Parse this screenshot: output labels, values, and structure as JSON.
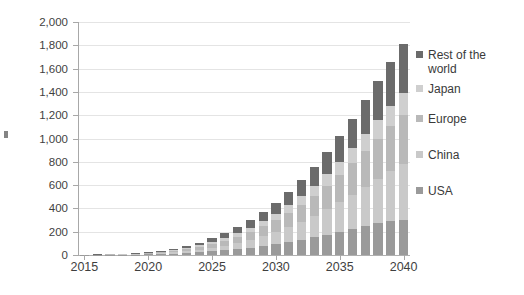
{
  "chart_data": {
    "type": "bar",
    "title": "",
    "subtitle": "",
    "xlabel": "",
    "ylabel": "",
    "stacked": true,
    "grid": true,
    "legend_position": "right",
    "ylim": [
      0,
      2000
    ],
    "ytick_step": 200,
    "ytick_labels": [
      "2,000",
      "1,800",
      "1,600",
      "1,400",
      "1,200",
      "1,000",
      "800",
      "600",
      "400",
      "200",
      "0"
    ],
    "ytick_values": [
      2000,
      1800,
      1600,
      1400,
      1200,
      1000,
      800,
      600,
      400,
      200,
      0
    ],
    "x": [
      2015,
      2016,
      2017,
      2018,
      2019,
      2020,
      2021,
      2022,
      2023,
      2024,
      2025,
      2026,
      2027,
      2028,
      2029,
      2030,
      2031,
      2032,
      2033,
      2034,
      2035,
      2036,
      2037,
      2038,
      2039,
      2040
    ],
    "xtick_labels": [
      "2015",
      "2020",
      "2025",
      "2030",
      "2035",
      "2040"
    ],
    "xtick_values": [
      2015,
      2020,
      2025,
      2030,
      2035,
      2040
    ],
    "categories": [
      "2015",
      "2016",
      "2017",
      "2018",
      "2019",
      "2020",
      "2021",
      "2022",
      "2023",
      "2024",
      "2025",
      "2026",
      "2027",
      "2028",
      "2029",
      "2030",
      "2031",
      "2032",
      "2033",
      "2034",
      "2035",
      "2036",
      "2037",
      "2038",
      "2039",
      "2040"
    ],
    "series": [
      {
        "name": "USA",
        "color": "#9a9a9a",
        "values": [
          1,
          1,
          2,
          3,
          4,
          6,
          9,
          13,
          18,
          24,
          32,
          41,
          52,
          64,
          78,
          94,
          112,
          132,
          153,
          176,
          200,
          225,
          250,
          272,
          290,
          300
        ]
      },
      {
        "name": "China",
        "color": "#c9c9c9",
        "values": [
          0,
          1,
          1,
          2,
          3,
          5,
          7,
          11,
          16,
          22,
          30,
          40,
          52,
          66,
          83,
          103,
          126,
          152,
          182,
          215,
          252,
          292,
          336,
          383,
          432,
          480
        ]
      },
      {
        "name": "Europe",
        "color": "#b9b9b9",
        "values": [
          1,
          1,
          2,
          3,
          4,
          6,
          9,
          13,
          18,
          25,
          33,
          43,
          55,
          69,
          85,
          104,
          125,
          149,
          175,
          204,
          236,
          270,
          306,
          344,
          382,
          420
        ]
      },
      {
        "name": "Japan",
        "color": "#cfcfcf",
        "values": [
          0,
          1,
          1,
          1,
          2,
          3,
          5,
          7,
          10,
          13,
          18,
          23,
          29,
          36,
          44,
          53,
          63,
          74,
          86,
          99,
          113,
          128,
          143,
          159,
          175,
          190
        ]
      },
      {
        "name": "Rest of the world",
        "color": "#6b6b6b",
        "values": [
          0,
          1,
          1,
          2,
          3,
          5,
          8,
          11,
          16,
          22,
          30,
          39,
          50,
          63,
          78,
          95,
          115,
          137,
          162,
          190,
          221,
          255,
          292,
          332,
          374,
          420
        ]
      }
    ],
    "totals": [
      2,
      5,
      7,
      11,
      16,
      25,
      38,
      55,
      78,
      106,
      143,
      186,
      238,
      298,
      368,
      449,
      541,
      644,
      758,
      884,
      1022,
      1170,
      1327,
      1490,
      1653,
      1810
    ]
  },
  "legend": {
    "items": [
      {
        "label": "Rest of the\nworld",
        "color": "#6b6b6b"
      },
      {
        "label": "Japan",
        "color": "#cfcfcf"
      },
      {
        "label": "Europe",
        "color": "#b9b9b9"
      },
      {
        "label": "China",
        "color": "#c9c9c9"
      },
      {
        "label": "USA",
        "color": "#9a9a9a"
      }
    ]
  }
}
